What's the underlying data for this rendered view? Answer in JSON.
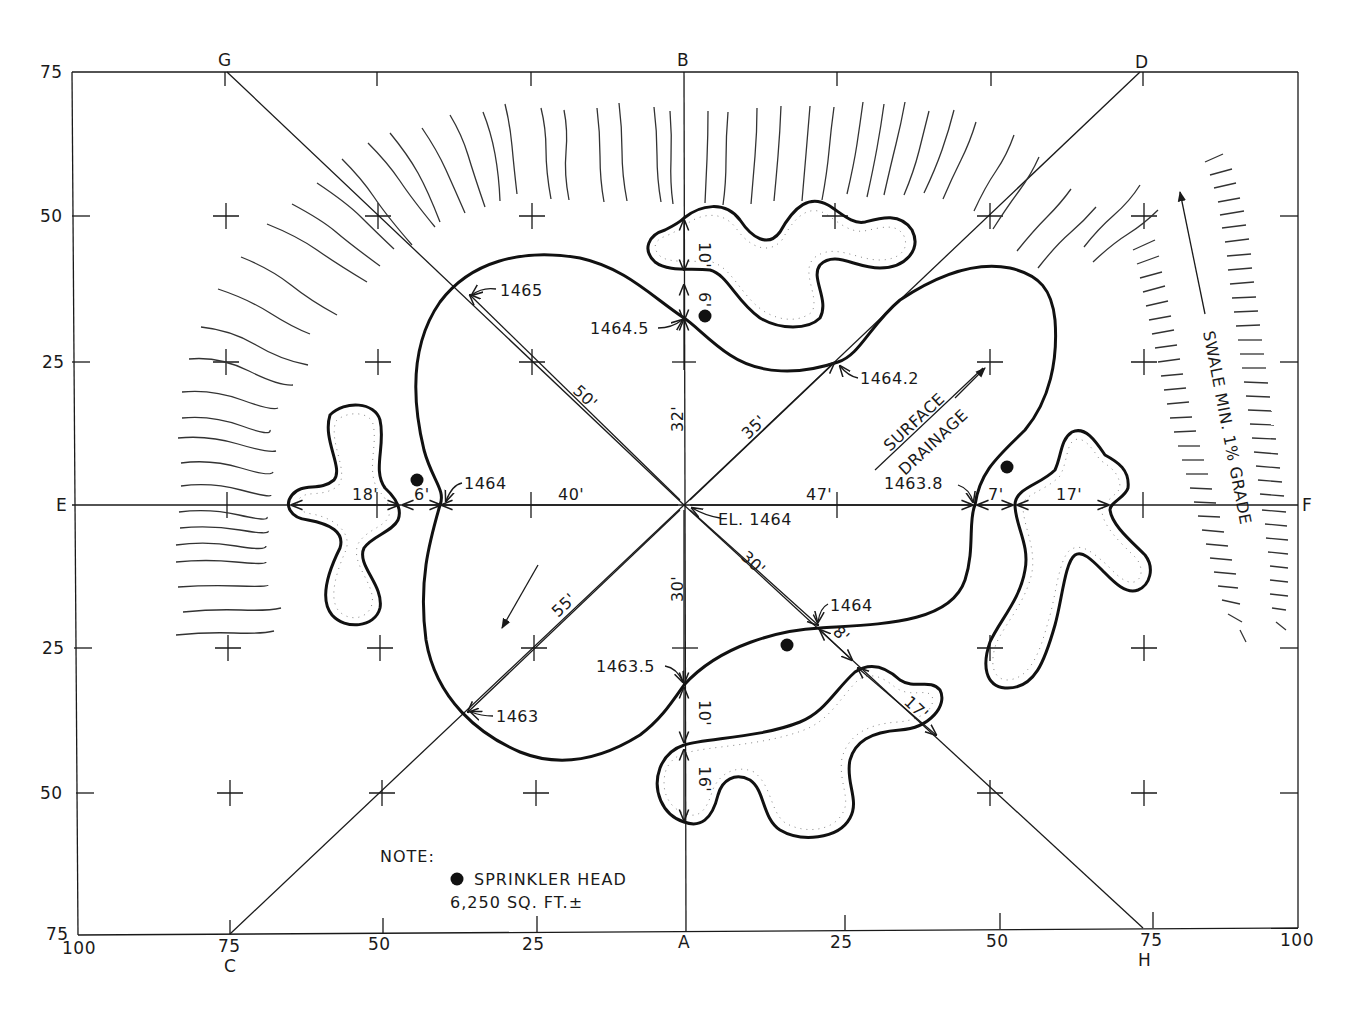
{
  "drawing": {
    "title": "Green grading plan",
    "colors": {
      "ink": "#1a1a1a",
      "paper": "#ffffff"
    },
    "axes": {
      "left_ticks": [
        "75",
        "50",
        "25",
        "E",
        "25",
        "50",
        "75"
      ],
      "right_label": "F",
      "bottom_ticks": [
        "100",
        "75",
        "50",
        "25",
        "A",
        "25",
        "50",
        "75",
        "100"
      ],
      "top_letters": {
        "g": "G",
        "b": "B",
        "d": "D"
      },
      "bottom_letters": {
        "c": "C",
        "h": "H"
      }
    },
    "elevations": {
      "center": "EL. 1464",
      "e1465": "1465",
      "e1464_5": "1464.5",
      "e1464_2": "1464.2",
      "e1464_left": "1464",
      "e1463_8": "1463.8",
      "e1464_lower": "1464",
      "e1463_5": "1463.5",
      "e1463": "1463"
    },
    "dimensions": {
      "d50": "50'",
      "d32": "32'",
      "d35": "35'",
      "d40": "40'",
      "d47": "47'",
      "d55": "55'",
      "d30v": "30'",
      "d30d": "30'",
      "d18": "18'",
      "d6l": "6'",
      "d10t": "10'",
      "d6t": "6'",
      "d7": "7'",
      "d17r": "17'",
      "d8": "8'",
      "d17b": "17'",
      "d10b": "10'",
      "d16": "16'"
    },
    "annotations": {
      "surface": "SURFACE",
      "drainage": "DRAINAGE",
      "swale": "SWALE MIN. 1% GRADE"
    },
    "note": {
      "heading": "NOTE:",
      "sprinkler": "SPRINKLER HEAD",
      "area": "6,250 SQ. FT.±"
    }
  }
}
